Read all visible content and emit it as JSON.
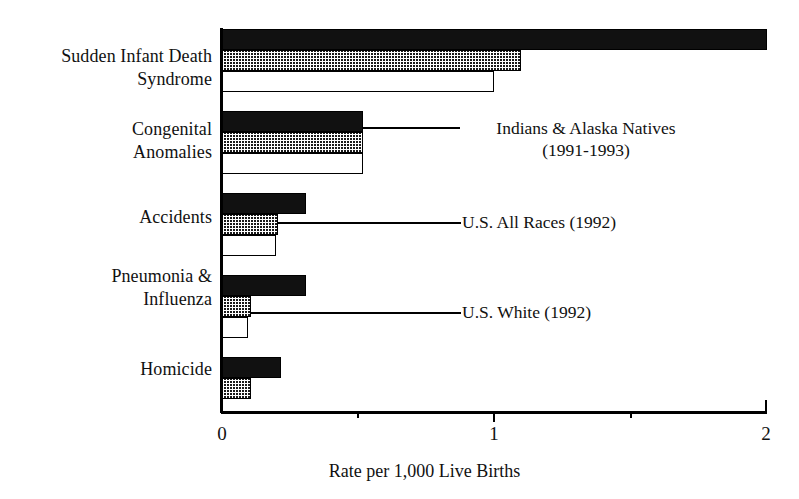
{
  "chart_data": {
    "type": "bar",
    "orientation": "horizontal",
    "title": "",
    "xlabel": "Rate per 1,000 Live Births",
    "ylabel": "",
    "xlim": [
      0,
      2
    ],
    "xticks": [
      0,
      1,
      2
    ],
    "xtick_labels": [
      "0",
      "1",
      "2"
    ],
    "minor_xticks": [
      0.5,
      1.5
    ],
    "grid": false,
    "legend_position": "inline-annotations",
    "categories": [
      "Sudden Infant Death\nSyndrome",
      "Congenital\nAnomalies",
      "Accidents",
      "Pneumonia &\nInfluenza",
      "Homicide"
    ],
    "series": [
      {
        "name": "Indians & Alaska Natives\n(1991-1993)",
        "fill": "black",
        "values": [
          2.0,
          0.52,
          0.31,
          0.31,
          0.22
        ]
      },
      {
        "name": "U.S. All Races (1992)",
        "fill": "hatched",
        "values": [
          1.1,
          0.52,
          0.21,
          0.11,
          0.11
        ]
      },
      {
        "name": "U.S. White (1992)",
        "fill": "white",
        "values": [
          1.0,
          0.52,
          0.2,
          0.1,
          0.0
        ]
      }
    ],
    "annotations": [
      {
        "text": "Indians & Alaska Natives\n(1991-1993)",
        "points_to": "Congenital Anomalies, black bar"
      },
      {
        "text": "U.S. All Races (1992)",
        "points_to": "Accidents, hatched bar"
      },
      {
        "text": "U.S. White (1992)",
        "points_to": "Pneumonia & Influenza, white bar"
      }
    ]
  },
  "colors": {
    "series_black": "#111111",
    "series_hatch": "#1a1a1a",
    "series_white": "#ffffff",
    "axis": "#000000",
    "background": "#ffffff"
  }
}
